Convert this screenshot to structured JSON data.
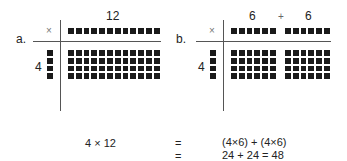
{
  "panel_a": {
    "label": "a.",
    "operator": "×",
    "top_value": "12",
    "left_value": "4",
    "top_squares": 12,
    "left_squares": 4,
    "grid_rows": 4,
    "grid_cols": 12
  },
  "panel_b": {
    "label": "b.",
    "operator": "×",
    "top_value_1": "6",
    "top_plus": "+",
    "top_value_2": "6",
    "left_value": "4",
    "group_1_cols": 6,
    "group_2_cols": 6,
    "left_squares": 4,
    "grid_rows": 4
  },
  "equation": {
    "lhs": "4 × 12",
    "eq1": "=",
    "rhs1": "(4×6) + (4×6)",
    "eq2": "=",
    "rhs2": "24 + 24 = 48"
  },
  "colors": {
    "square": "#1a1a1a",
    "line": "#555555",
    "operator": "#777777"
  }
}
